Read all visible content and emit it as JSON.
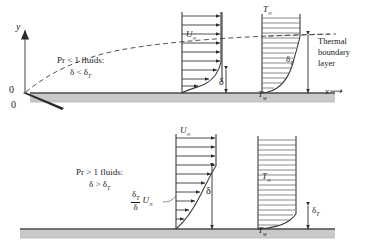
{
  "figure": {
    "axes": {
      "y_label": "y",
      "x_label": "x⟶",
      "origin_y": "0",
      "origin_x": "0"
    },
    "colors": {
      "ink": "#1a1a1a",
      "wall": "#c9c9c9",
      "wall_edge": "#4a4a4a",
      "dashed": "#555555",
      "profile_line": "#3a3a3a"
    },
    "upper_panel": {
      "condition_line1": "Pr < 1 fluids:",
      "condition_line2": "δ < δT",
      "velocity_label": "U∞",
      "temperature_label": "T∞",
      "wall_temperature_label": "Tw",
      "velocity_thickness_label": "δ",
      "thermal_thickness_label": "δT",
      "callout_line1": "Thermal",
      "callout_line2": "boundary",
      "callout_line3": "layer"
    },
    "lower_panel": {
      "condition_line1": "Pr > 1 fluids:",
      "condition_line2": "δ > δT",
      "velocity_label": "U∞",
      "temperature_label": "T∞",
      "wall_temperature_label": "Tw",
      "velocity_thickness_label": "δ",
      "thermal_thickness_label": "δT",
      "ratio_numerator": "δT",
      "ratio_denominator": "δ",
      "ratio_factor": "U∞"
    }
  }
}
